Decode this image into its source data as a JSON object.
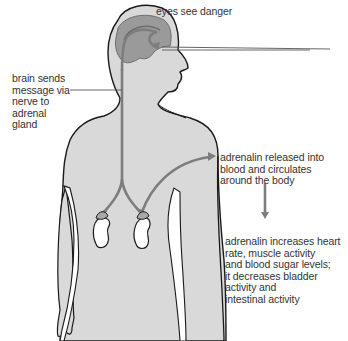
{
  "diagram": {
    "type": "adrenalin response pathway",
    "labels": {
      "eyes": "eyes see danger",
      "brain": "brain sends\nmessage via\nnerve to\nadrenal\ngland",
      "released": "adrenalin released into\nblood and circulates\naround the body",
      "effects": "adrenalin increases heart\nrate, muscle activity\nand blood sugar levels;\nit decreases bladder\nactivity and\nintestinal activity"
    },
    "colors": {
      "body_fill": "#d9d9d9",
      "outline": "#1a1a1a",
      "brain_fill": "#9a9a9a",
      "pathway": "#7d7d7d",
      "kidney_fill": "#ffffff",
      "adrenal_fill": "#a8a8a8",
      "text": "#333333",
      "leader_line": "#555555"
    }
  }
}
